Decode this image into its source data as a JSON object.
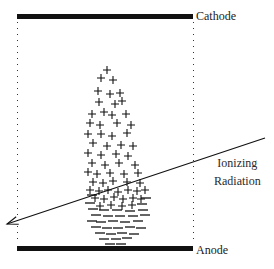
{
  "diagram": {
    "electrodes": {
      "cathode": {
        "label": "Cathode",
        "x1": 17,
        "x2": 193,
        "y": 14,
        "thickness": 5
      },
      "anode": {
        "label": "Anode",
        "x1": 17,
        "x2": 193,
        "y": 246,
        "thickness": 5
      }
    },
    "field_boundaries": {
      "style": "dotted",
      "left_x": 17,
      "right_x": 193,
      "y_top": 22,
      "y_bottom": 243
    },
    "radiation": {
      "label_line1": "Ionizing",
      "label_line2": "Radiation",
      "start": [
        265,
        138
      ],
      "end": [
        7,
        224
      ],
      "arrowhead": "end"
    },
    "charges": {
      "positive_symbol": "+",
      "negative_symbol": "−",
      "positive": [
        [
          107,
          70
        ],
        [
          101,
          78
        ],
        [
          113,
          80
        ],
        [
          98,
          91
        ],
        [
          110,
          94
        ],
        [
          120,
          93
        ],
        [
          99,
          102
        ],
        [
          115,
          104
        ],
        [
          122,
          101
        ],
        [
          92,
          114
        ],
        [
          104,
          112
        ],
        [
          112,
          115
        ],
        [
          126,
          114
        ],
        [
          90,
          123
        ],
        [
          100,
          125
        ],
        [
          117,
          123
        ],
        [
          131,
          125
        ],
        [
          88,
          134
        ],
        [
          101,
          134
        ],
        [
          112,
          136
        ],
        [
          127,
          133
        ],
        [
          93,
          143
        ],
        [
          107,
          146
        ],
        [
          121,
          145
        ],
        [
          133,
          146
        ],
        [
          88,
          153
        ],
        [
          101,
          155
        ],
        [
          116,
          154
        ],
        [
          128,
          156
        ],
        [
          92,
          163
        ],
        [
          105,
          165
        ],
        [
          119,
          163
        ],
        [
          135,
          165
        ],
        [
          88,
          172
        ],
        [
          97,
          174
        ],
        [
          110,
          173
        ],
        [
          124,
          174
        ],
        [
          138,
          173
        ],
        [
          93,
          182
        ],
        [
          103,
          183
        ],
        [
          113,
          181
        ],
        [
          127,
          182
        ],
        [
          140,
          183
        ],
        [
          90,
          190
        ],
        [
          99,
          191
        ],
        [
          108,
          190
        ],
        [
          118,
          192
        ],
        [
          128,
          190
        ],
        [
          137,
          191
        ],
        [
          145,
          190
        ],
        [
          95,
          198
        ],
        [
          104,
          199
        ],
        [
          114,
          197
        ],
        [
          123,
          199
        ],
        [
          133,
          198
        ],
        [
          141,
          199
        ],
        [
          100,
          206
        ],
        [
          111,
          205
        ],
        [
          122,
          206
        ],
        [
          132,
          205
        ]
      ],
      "negative": [
        [
          92,
          195
        ],
        [
          146,
          198
        ],
        [
          90,
          203
        ],
        [
          142,
          204
        ],
        [
          93,
          209
        ],
        [
          104,
          210
        ],
        [
          117,
          210
        ],
        [
          130,
          211
        ],
        [
          143,
          210
        ],
        [
          96,
          215
        ],
        [
          108,
          216
        ],
        [
          120,
          216
        ],
        [
          133,
          216
        ],
        [
          145,
          215
        ],
        [
          92,
          221
        ],
        [
          101,
          222
        ],
        [
          113,
          221
        ],
        [
          125,
          222
        ],
        [
          138,
          221
        ],
        [
          96,
          227
        ],
        [
          107,
          228
        ],
        [
          118,
          228
        ],
        [
          130,
          227
        ],
        [
          141,
          228
        ],
        [
          100,
          233
        ],
        [
          111,
          234
        ],
        [
          122,
          233
        ],
        [
          134,
          234
        ],
        [
          104,
          239
        ],
        [
          116,
          239
        ],
        [
          127,
          238
        ],
        [
          110,
          244
        ],
        [
          121,
          244
        ]
      ]
    },
    "colors": {
      "ink": "#111111",
      "text": "#1a1a1a",
      "background": "#ffffff"
    }
  }
}
